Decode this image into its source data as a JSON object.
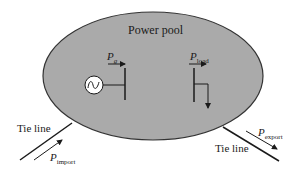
{
  "diagram": {
    "title": "Power pool",
    "colors": {
      "pool_fill": "#aaaaaa",
      "stroke": "#1a1a1a",
      "background": "#ffffff",
      "generator_fill": "#ffffff"
    },
    "generator": {
      "label_main": "P",
      "label_sub": "g",
      "icon": "ac-generator-icon"
    },
    "load": {
      "label_main": "P",
      "label_sub": "load",
      "icon": "load-arrow-icon"
    },
    "tie_line_left": {
      "label": "Tie line",
      "flow_main": "P",
      "flow_sub": "import"
    },
    "tie_line_right": {
      "label": "Tie line",
      "flow_main": "P",
      "flow_sub": "export"
    }
  }
}
